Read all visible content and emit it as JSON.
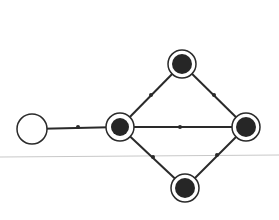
{
  "diagram": {
    "type": "graph",
    "colors": {
      "background": "#ffffff",
      "edge": "#2a2a2a",
      "node_fill": "#262626",
      "node_ring": "#2a2a2a",
      "guide_line": "#c8c8c8"
    },
    "guide_line": {
      "x1": 0,
      "y1": 157,
      "x2": 279,
      "y2": 155
    },
    "nodes": [
      {
        "id": "empty",
        "x": 32,
        "y": 129,
        "r_outer": 15,
        "r_inner": 0,
        "filled": false
      },
      {
        "id": "hub",
        "x": 120,
        "y": 127,
        "r_outer": 14,
        "r_inner": 9,
        "filled": true
      },
      {
        "id": "top",
        "x": 182,
        "y": 64,
        "r_outer": 14,
        "r_inner": 10,
        "filled": true
      },
      {
        "id": "right",
        "x": 246,
        "y": 127,
        "r_outer": 14,
        "r_inner": 10,
        "filled": true
      },
      {
        "id": "bottom",
        "x": 185,
        "y": 188,
        "r_outer": 14,
        "r_inner": 10,
        "filled": true
      }
    ],
    "edges": [
      {
        "from": "hub",
        "to": "empty",
        "marker": [
          78,
          127
        ]
      },
      {
        "from": "hub",
        "to": "right",
        "marker": [
          180,
          127
        ]
      },
      {
        "from": "hub",
        "to": "top",
        "marker": [
          151,
          95
        ]
      },
      {
        "from": "top",
        "to": "right",
        "marker": [
          214,
          95
        ]
      },
      {
        "from": "hub",
        "to": "bottom",
        "marker": [
          153,
          157
        ]
      },
      {
        "from": "bottom",
        "to": "right",
        "marker": [
          217,
          155
        ]
      }
    ]
  }
}
